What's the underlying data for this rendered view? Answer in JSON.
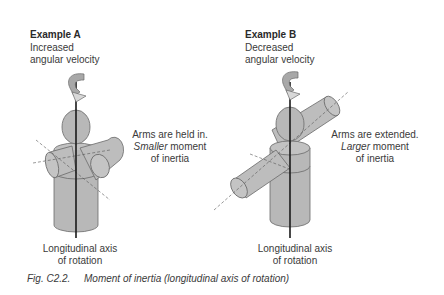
{
  "example_a": {
    "title": "Example A",
    "subtitle_line1": "Increased",
    "subtitle_line2": "angular velocity",
    "note_line1": "Arms are held in.",
    "note_line2_italic": "Smaller",
    "note_line2_rest": " moment",
    "note_line3": "of inertia",
    "axis_line1": "Longitudinal axis",
    "axis_line2": "of rotation"
  },
  "example_b": {
    "title": "Example B",
    "subtitle_line1": "Decreased",
    "subtitle_line2": "angular velocity",
    "note_line1": "Arms are extended.",
    "note_line2_italic": "Larger",
    "note_line2_rest": " moment",
    "note_line3": "of inertia",
    "axis_line1": "Longitudinal axis",
    "axis_line2": "of rotation"
  },
  "caption": {
    "label": "Fig. C2.2.",
    "text": "Moment of inertia (longitudinal axis of rotation)"
  },
  "colors": {
    "body_fill": "#b8b8b8",
    "outline": "#6a6a6a",
    "axis": "#1a1a1a",
    "text": "#3a3a3a"
  }
}
